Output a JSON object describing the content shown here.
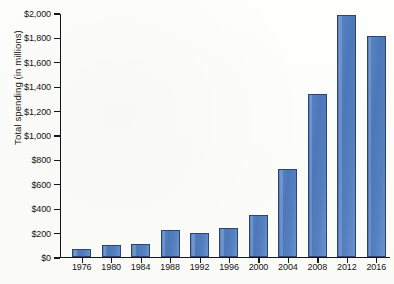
{
  "chart_data": {
    "type": "bar",
    "title": "",
    "xlabel": "",
    "ylabel": "Total spending (in millions)",
    "categories": [
      "1976",
      "1980",
      "1984",
      "1988",
      "1992",
      "1996",
      "2000",
      "2004",
      "2008",
      "2012",
      "2016"
    ],
    "values": [
      65,
      92,
      103,
      215,
      190,
      232,
      345,
      715,
      1330,
      1980,
      1805
    ],
    "ylim": [
      0,
      2000
    ],
    "ytick_values": [
      0,
      200,
      400,
      600,
      800,
      1000,
      1200,
      1400,
      1600,
      1800,
      2000
    ],
    "ytick_labels": [
      "$0",
      "$200",
      "$400",
      "$600",
      "$800",
      "$1,000",
      "$1,200",
      "$1,400",
      "$1,600",
      "$1,800",
      "$2,000"
    ],
    "grid": false,
    "legend": null,
    "bar_color": "#4f7cbf",
    "bar_border_color": "#2c4472",
    "axis_color": "#14161a",
    "background_color": "#fdfdfb"
  }
}
